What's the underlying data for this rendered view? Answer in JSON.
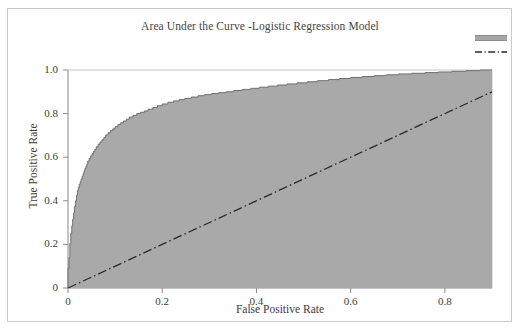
{
  "chart_data": {
    "type": "area",
    "title": "Area Under the Curve -Logistic Regression Model",
    "xlabel": "False Positive Rate",
    "ylabel": "True Positive Rate",
    "xlim": [
      0,
      0.9
    ],
    "ylim": [
      0,
      1.0
    ],
    "grid": false,
    "legend_position": "top-right",
    "xticks": [
      "0",
      "0.2",
      "0.4",
      "0.6",
      "0.8"
    ],
    "xtick_values": [
      0,
      0.2,
      0.4,
      0.6,
      0.8
    ],
    "yticks": [
      "0",
      "0.2",
      "0.4",
      "0.6",
      "0.8",
      "1.0"
    ],
    "ytick_values": [
      0,
      0.2,
      0.4,
      0.6,
      0.8,
      1.0
    ],
    "fill_color": "#a9a9a9",
    "curve_color": "#6e6e6e",
    "reference_line_color": "#2b2b2b",
    "series": [
      {
        "name": "roc-curve",
        "style": "filled-step-area",
        "x": [
          0.0,
          0.002,
          0.004,
          0.004,
          0.006,
          0.006,
          0.008,
          0.008,
          0.01,
          0.01,
          0.012,
          0.012,
          0.014,
          0.014,
          0.016,
          0.016,
          0.018,
          0.018,
          0.02,
          0.02,
          0.022,
          0.024,
          0.026,
          0.028,
          0.03,
          0.032,
          0.034,
          0.036,
          0.038,
          0.04,
          0.042,
          0.045,
          0.048,
          0.051,
          0.054,
          0.057,
          0.06,
          0.064,
          0.068,
          0.072,
          0.076,
          0.08,
          0.085,
          0.09,
          0.095,
          0.1,
          0.106,
          0.112,
          0.118,
          0.124,
          0.13,
          0.138,
          0.146,
          0.154,
          0.162,
          0.17,
          0.18,
          0.19,
          0.2,
          0.212,
          0.224,
          0.236,
          0.248,
          0.262,
          0.276,
          0.29,
          0.305,
          0.32,
          0.336,
          0.352,
          0.37,
          0.388,
          0.406,
          0.425,
          0.445,
          0.465,
          0.486,
          0.508,
          0.53,
          0.553,
          0.576,
          0.6,
          0.625,
          0.65,
          0.676,
          0.702,
          0.73,
          0.758,
          0.786,
          0.815,
          0.845,
          0.875,
          0.9
        ],
        "y": [
          0.0,
          0.09,
          0.14,
          0.175,
          0.205,
          0.23,
          0.25,
          0.268,
          0.285,
          0.3,
          0.315,
          0.33,
          0.345,
          0.36,
          0.374,
          0.388,
          0.4,
          0.412,
          0.424,
          0.436,
          0.448,
          0.462,
          0.476,
          0.488,
          0.5,
          0.512,
          0.524,
          0.536,
          0.548,
          0.558,
          0.568,
          0.582,
          0.594,
          0.606,
          0.616,
          0.626,
          0.636,
          0.648,
          0.66,
          0.67,
          0.68,
          0.69,
          0.702,
          0.712,
          0.722,
          0.73,
          0.74,
          0.75,
          0.758,
          0.766,
          0.774,
          0.784,
          0.792,
          0.8,
          0.806,
          0.812,
          0.82,
          0.828,
          0.836,
          0.844,
          0.852,
          0.858,
          0.864,
          0.87,
          0.876,
          0.882,
          0.887,
          0.892,
          0.896,
          0.9,
          0.906,
          0.911,
          0.916,
          0.921,
          0.926,
          0.931,
          0.936,
          0.941,
          0.946,
          0.951,
          0.956,
          0.961,
          0.966,
          0.97,
          0.974,
          0.978,
          0.982,
          0.985,
          0.988,
          0.991,
          0.994,
          0.997,
          1.0
        ]
      },
      {
        "name": "reference-diagonal",
        "style": "dash-dot",
        "x": [
          0,
          0.9
        ],
        "y": [
          0,
          0.9
        ]
      }
    ],
    "legend_entries": [
      {
        "name": "area-swatch",
        "style": "filled-bar",
        "color": "#a6a6a6",
        "label": ""
      },
      {
        "name": "reference-line-swatch",
        "style": "dash-dot",
        "color": "#2b2b2b",
        "label": ""
      }
    ]
  }
}
